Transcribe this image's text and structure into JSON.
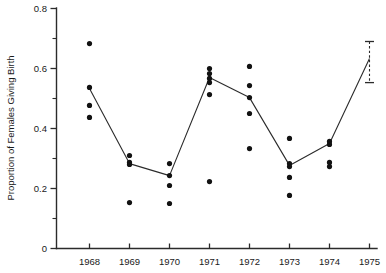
{
  "chart_data": {
    "type": "scatter",
    "title": "",
    "xlabel": "",
    "ylabel": "Proportion of Females Giving Birth",
    "xlim": [
      1967.5,
      1975.5
    ],
    "ylim": [
      0,
      0.8
    ],
    "grid": false,
    "legend": null,
    "x_tick_labels": [
      "1968",
      "1969",
      "1970",
      "1971",
      "1972",
      "1973",
      "1974",
      "1975"
    ],
    "x_ticks": [
      1968,
      1969,
      1970,
      1971,
      1972,
      1973,
      1974,
      1975
    ],
    "y_tick_labels": [
      "0",
      "0.2",
      "0.4",
      "0.6",
      "0.8"
    ],
    "y_ticks": [
      0,
      0.2,
      0.4,
      0.6,
      0.8
    ],
    "y_minor_ticks": [
      0.1,
      0.3,
      0.5,
      0.7
    ],
    "point_series": {
      "name": "Individual observations",
      "points": [
        {
          "x": 1968,
          "y": 0.683
        },
        {
          "x": 1968,
          "y": 0.537
        },
        {
          "x": 1968,
          "y": 0.477
        },
        {
          "x": 1968,
          "y": 0.437
        },
        {
          "x": 1969,
          "y": 0.31
        },
        {
          "x": 1969,
          "y": 0.287
        },
        {
          "x": 1969,
          "y": 0.28
        },
        {
          "x": 1969,
          "y": 0.153
        },
        {
          "x": 1970,
          "y": 0.283
        },
        {
          "x": 1970,
          "y": 0.243
        },
        {
          "x": 1970,
          "y": 0.21
        },
        {
          "x": 1970,
          "y": 0.15
        },
        {
          "x": 1971,
          "y": 0.6
        },
        {
          "x": 1971,
          "y": 0.583
        },
        {
          "x": 1971,
          "y": 0.567
        },
        {
          "x": 1971,
          "y": 0.553
        },
        {
          "x": 1971,
          "y": 0.513
        },
        {
          "x": 1971,
          "y": 0.223
        },
        {
          "x": 1972,
          "y": 0.607
        },
        {
          "x": 1972,
          "y": 0.543
        },
        {
          "x": 1972,
          "y": 0.503
        },
        {
          "x": 1972,
          "y": 0.45
        },
        {
          "x": 1972,
          "y": 0.333
        },
        {
          "x": 1973,
          "y": 0.367
        },
        {
          "x": 1973,
          "y": 0.283
        },
        {
          "x": 1973,
          "y": 0.273
        },
        {
          "x": 1973,
          "y": 0.237
        },
        {
          "x": 1973,
          "y": 0.177
        },
        {
          "x": 1974,
          "y": 0.357
        },
        {
          "x": 1974,
          "y": 0.347
        },
        {
          "x": 1974,
          "y": 0.287
        },
        {
          "x": 1974,
          "y": 0.273
        }
      ]
    },
    "mean_series": {
      "name": "Annual mean",
      "x": [
        1968,
        1969,
        1970,
        1971,
        1972,
        1973,
        1974,
        1975
      ],
      "values": [
        0.533,
        0.283,
        0.243,
        0.57,
        0.503,
        0.277,
        0.35,
        0.633
      ]
    },
    "error_bars": [
      {
        "x": 1975,
        "center": 0.62,
        "upper": 0.69,
        "lower": 0.553,
        "style": "dashed"
      }
    ]
  },
  "colors": {
    "axis": "#2b2b2b",
    "point": "#121212",
    "line": "#2b2b2b",
    "background": "#ffffff"
  }
}
